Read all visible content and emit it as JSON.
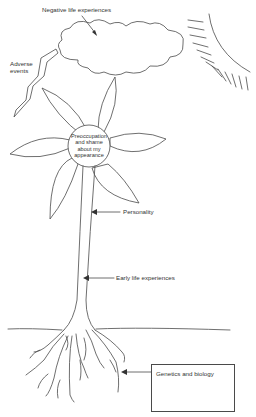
{
  "diagram": {
    "type": "illustrated metaphor",
    "labels": {
      "cloud": "Negative life experiences",
      "lightning_line1": "Adverse",
      "lightning_line2": "events",
      "center_line1": "Preoccupation",
      "center_line2": "and shame",
      "center_line3": "about my",
      "center_line4": "appearance",
      "stem_upper": "Personality",
      "stem_lower": "Early life experiences",
      "roots": "Genetics and biology"
    },
    "elements": [
      "cloud",
      "lightning bolt",
      "sun",
      "flower head",
      "stem",
      "ground line",
      "roots",
      "text box"
    ],
    "colors": {
      "line": "#4a4a4a",
      "background": "#ffffff",
      "text": "#333333"
    }
  }
}
